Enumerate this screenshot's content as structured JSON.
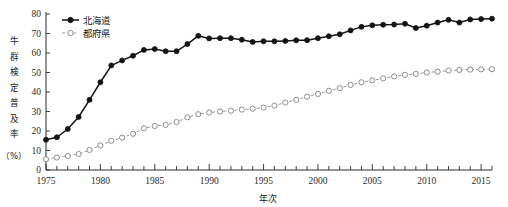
{
  "chart_data": {
    "type": "line",
    "title": "",
    "xlabel": "年次",
    "ylabel": "牛群検定普及率（%）",
    "ylabel_chars": [
      "牛",
      "群",
      "検",
      "定",
      "普",
      "及",
      "率",
      "（%）"
    ],
    "xlim": [
      1975,
      2016
    ],
    "ylim": [
      0,
      80
    ],
    "ytick_values": [
      0,
      10,
      20,
      30,
      40,
      50,
      60,
      70,
      80
    ],
    "ytick_labels": [
      "0",
      "10",
      "20",
      "30",
      "40",
      "50",
      "60",
      "70",
      "80"
    ],
    "xtick_labels": [
      "1975",
      "1980",
      "1985",
      "1990",
      "1995",
      "2000",
      "2005",
      "2010",
      "2015"
    ],
    "xtick_values": [
      1975,
      1980,
      1985,
      1990,
      1995,
      2000,
      2005,
      2010,
      2015
    ],
    "x_minor_step": 1,
    "grid": false,
    "legend_position": "top-left",
    "x": [
      1975,
      1976,
      1977,
      1978,
      1979,
      1980,
      1981,
      1982,
      1983,
      1984,
      1985,
      1986,
      1987,
      1988,
      1989,
      1990,
      1991,
      1992,
      1993,
      1994,
      1995,
      1996,
      1997,
      1998,
      1999,
      2000,
      2001,
      2002,
      2003,
      2004,
      2005,
      2006,
      2007,
      2008,
      2009,
      2010,
      2011,
      2012,
      2013,
      2014,
      2015,
      2016
    ],
    "series": [
      {
        "name": "北海道",
        "marker": "filled-circle",
        "color": "#141414",
        "linestyle": "solid",
        "values": [
          15.5,
          16.8,
          21.0,
          27.2,
          36.0,
          45.0,
          53.6,
          56.2,
          58.6,
          61.6,
          62.0,
          60.9,
          60.9,
          64.6,
          68.8,
          67.5,
          67.6,
          67.6,
          66.8,
          65.7,
          66.0,
          66.0,
          66.2,
          66.5,
          66.6,
          67.6,
          68.6,
          69.6,
          71.6,
          73.4,
          74.2,
          74.5,
          74.6,
          75.0,
          72.8,
          74.0,
          75.6,
          77.0,
          75.6,
          77.2,
          77.4,
          77.6
        ]
      },
      {
        "name": "都府県",
        "marker": "open-circle",
        "color": "#8d8d8d",
        "linestyle": "dashed",
        "values": [
          5.5,
          6.4,
          7.2,
          8.2,
          10.3,
          12.6,
          15.0,
          16.6,
          18.6,
          21.4,
          22.6,
          23.1,
          24.6,
          27.0,
          28.6,
          29.5,
          30.0,
          30.4,
          31.0,
          31.4,
          32.0,
          33.0,
          34.6,
          36.0,
          37.6,
          39.0,
          40.6,
          42.0,
          43.6,
          45.0,
          46.0,
          47.0,
          48.0,
          48.8,
          49.3,
          50.0,
          50.4,
          51.0,
          51.3,
          51.5,
          51.6,
          51.7
        ]
      }
    ]
  },
  "legend": {
    "items": [
      {
        "label": "北海道",
        "marker": "filled-circle"
      },
      {
        "label": "都府県",
        "marker": "open-circle"
      }
    ]
  }
}
